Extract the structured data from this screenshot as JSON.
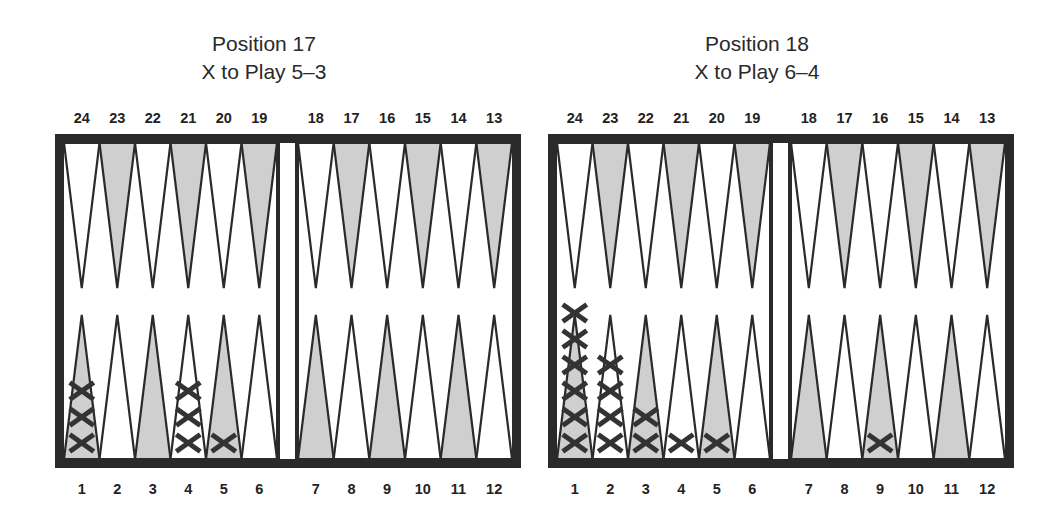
{
  "colors": {
    "frame": "#2a2a2a",
    "shaded_point": "#cfcfcf",
    "light_point": "#ffffff",
    "checker": "#333333",
    "text": "#222222"
  },
  "positions": [
    {
      "title": "Position 17",
      "subtitle": "X to Play 5–3",
      "dice": [
        5,
        3
      ],
      "top_labels": [
        "24",
        "23",
        "22",
        "21",
        "20",
        "19",
        "18",
        "17",
        "16",
        "15",
        "14",
        "13"
      ],
      "bottom_labels": [
        "1",
        "2",
        "3",
        "4",
        "5",
        "6",
        "7",
        "8",
        "9",
        "10",
        "11",
        "12"
      ],
      "checkers": [
        {
          "point": 1,
          "count": 3,
          "player": "X"
        },
        {
          "point": 4,
          "count": 3,
          "player": "X"
        },
        {
          "point": 5,
          "count": 1,
          "player": "X"
        }
      ]
    },
    {
      "title": "Position 18",
      "subtitle": "X to Play 6–4",
      "dice": [
        6,
        4
      ],
      "top_labels": [
        "24",
        "23",
        "22",
        "21",
        "20",
        "19",
        "18",
        "17",
        "16",
        "15",
        "14",
        "13"
      ],
      "bottom_labels": [
        "1",
        "2",
        "3",
        "4",
        "5",
        "6",
        "7",
        "8",
        "9",
        "10",
        "11",
        "12"
      ],
      "checkers": [
        {
          "point": 1,
          "count": 6,
          "player": "X"
        },
        {
          "point": 2,
          "count": 4,
          "player": "X"
        },
        {
          "point": 3,
          "count": 2,
          "player": "X"
        },
        {
          "point": 4,
          "count": 1,
          "player": "X"
        },
        {
          "point": 5,
          "count": 1,
          "player": "X"
        },
        {
          "point": 9,
          "count": 1,
          "player": "X"
        }
      ]
    }
  ]
}
